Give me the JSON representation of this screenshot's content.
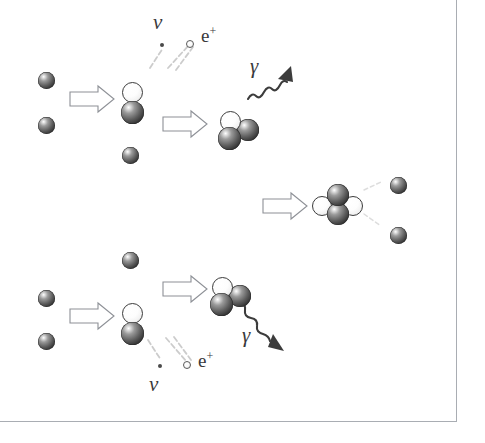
{
  "figure": {
    "background_color": "#ffffff",
    "frame_color": "#a9adb3",
    "width": 485,
    "height": 443
  },
  "legend_colors": {
    "proton": "#303030",
    "neutron": "#ffffff",
    "outline": "#3b3b3b",
    "arrow_outline": "#8d9096",
    "gamma_ray": "#3c3c3c",
    "trajectory": "#c9c9c9",
    "text": "#39393c"
  },
  "labels": {
    "neutrino_top": "ν",
    "positron_top_base": "e",
    "positron_top_sup": "+",
    "gamma_top": "γ",
    "neutrino_bottom": "ν",
    "positron_bottom_base": "e",
    "positron_bottom_sup": "+",
    "gamma_bottom": "γ"
  },
  "branches": {
    "top": {
      "name": "upper-pp-branch",
      "input_protons": [
        {
          "name": "proton-a",
          "x": 38,
          "y": 72,
          "d": 17
        },
        {
          "name": "proton-b",
          "x": 38,
          "y": 117,
          "d": 17
        }
      ],
      "fusion_arrow": {
        "x": 70,
        "y": 88,
        "w": 44,
        "h": 22
      },
      "deuteron": {
        "name": "deuteron-top",
        "neutron": {
          "x": 122,
          "y": 84,
          "d": 21
        },
        "proton": {
          "x": 121,
          "y": 103,
          "d": 23
        }
      },
      "free_proton": {
        "name": "third-proton-top",
        "x": 122,
        "y": 147,
        "d": 17
      },
      "capture_arrow": {
        "x": 163,
        "y": 113,
        "w": 44,
        "h": 22
      },
      "helium3": {
        "name": "helium-3-top",
        "neutron": {
          "x": 220,
          "y": 111,
          "d": 21
        },
        "proton_right": {
          "x": 237,
          "y": 119,
          "d": 22
        },
        "proton_lower": {
          "x": 218,
          "y": 127,
          "d": 23
        }
      },
      "gamma_label_pos": {
        "x": 250,
        "y": 56
      }
    },
    "bottom": {
      "name": "lower-pp-branch",
      "input_protons": [
        {
          "name": "proton-c",
          "x": 38,
          "y": 290,
          "d": 17
        },
        {
          "name": "proton-d",
          "x": 38,
          "y": 333,
          "d": 17
        }
      ],
      "fusion_arrow": {
        "x": 70,
        "y": 305,
        "w": 44,
        "h": 22
      },
      "deuteron": {
        "name": "deuteron-bottom",
        "neutron": {
          "x": 122,
          "y": 305,
          "d": 21
        },
        "proton": {
          "x": 121,
          "y": 324,
          "d": 23
        }
      },
      "free_proton": {
        "name": "third-proton-bottom",
        "x": 122,
        "y": 252,
        "d": 17
      },
      "capture_arrow": {
        "x": 163,
        "y": 278,
        "w": 44,
        "h": 22
      },
      "helium3": {
        "name": "helium-3-bottom",
        "neutron": {
          "x": 212,
          "y": 277,
          "d": 21
        },
        "proton_right": {
          "x": 229,
          "y": 285,
          "d": 22
        },
        "proton_lower": {
          "x": 210,
          "y": 293,
          "d": 23
        }
      },
      "gamma_label_pos": {
        "x": 242,
        "y": 325
      }
    },
    "merge": {
      "name": "helium-4-formation",
      "merge_arrow": {
        "x": 263,
        "y": 195,
        "w": 44,
        "h": 22
      },
      "helium4": {
        "name": "helium-4",
        "neutron_left": {
          "x": 316,
          "y": 196,
          "d": 20
        },
        "neutron_right": {
          "x": 345,
          "y": 196,
          "d": 20
        },
        "proton_top": {
          "x": 329,
          "y": 184,
          "d": 22
        },
        "proton_bottom": {
          "x": 329,
          "y": 203,
          "d": 22
        }
      },
      "ejected_protons": [
        {
          "name": "ejected-proton-upper",
          "x": 390,
          "y": 177,
          "d": 17
        },
        {
          "name": "ejected-proton-lower",
          "x": 390,
          "y": 227,
          "d": 17
        }
      ]
    }
  },
  "emission_particles": {
    "top": {
      "neutrino_dot": {
        "x": 160,
        "y": 43,
        "d": 4
      },
      "positron_dot": {
        "x": 186,
        "y": 40,
        "d": 7
      }
    },
    "bottom": {
      "neutrino_dot": {
        "x": 158,
        "y": 364,
        "d": 4
      },
      "positron_dot": {
        "x": 183,
        "y": 361,
        "d": 7
      }
    }
  }
}
